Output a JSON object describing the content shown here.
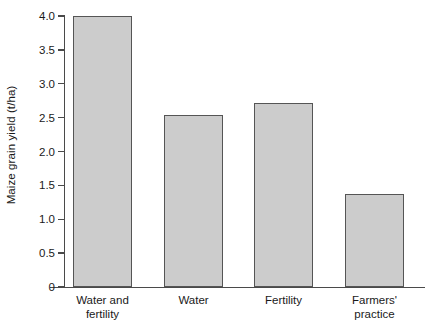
{
  "chart_data": {
    "type": "bar",
    "title": "",
    "subtitle": "",
    "xlabel": "",
    "ylabel": "Maize grain yield (t/ha)",
    "categories": [
      "Water and fertility",
      "Water",
      "Fertility",
      "Farmers' practice"
    ],
    "category_lines": [
      [
        "Water and",
        "fertility"
      ],
      [
        "Water",
        ""
      ],
      [
        "Fertility",
        ""
      ],
      [
        "Farmers'",
        "practice"
      ]
    ],
    "values": [
      4.0,
      2.54,
      2.72,
      1.37
    ],
    "ylim": [
      0,
      4.0
    ],
    "yticks": [
      0,
      0.5,
      1.0,
      1.5,
      2.0,
      2.5,
      3.0,
      3.5,
      4.0
    ],
    "ytick_labels": [
      "0",
      "0.5",
      "1.0",
      "1.5",
      "2.0",
      "2.5",
      "3.0",
      "3.5",
      "4.0"
    ],
    "grid": false,
    "legend": false,
    "legend_position": "none",
    "bar_fill_color": "#cccccc",
    "bar_edge_color": "#555555",
    "axis_color": "#4a4a4a",
    "background_color": "#ffffff"
  }
}
